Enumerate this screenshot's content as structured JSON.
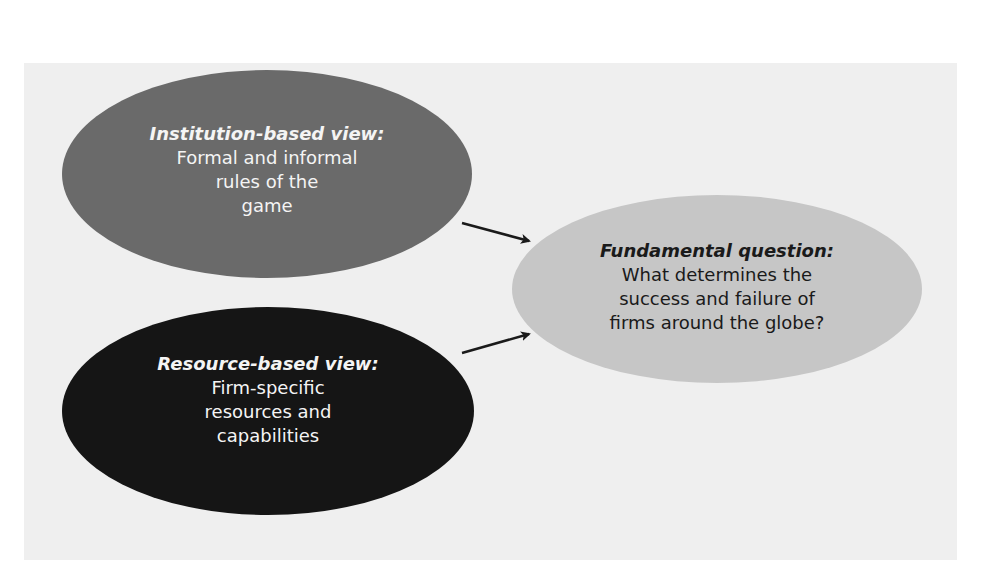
{
  "colors": {
    "background": "#ffffff",
    "panel": "#efefef",
    "institution_fill": "#6a6a6a",
    "resource_fill": "#151515",
    "question_fill": "#c6c6c6",
    "arrow": "#1a1a1a",
    "light_text": "#f4f4f4",
    "dark_text": "#1a1a1a"
  },
  "nodes": [
    {
      "id": "institution-based-view",
      "title": "Institution-based view:",
      "lines": [
        "Formal and informal",
        "rules of the",
        "game"
      ]
    },
    {
      "id": "resource-based-view",
      "title": "Resource-based view:",
      "lines": [
        "Firm-specific",
        "resources and",
        "capabilities"
      ]
    },
    {
      "id": "fundamental-question",
      "title": "Fundamental question:",
      "lines": [
        "What determines the",
        "success and failure of",
        "firms around the globe?"
      ]
    }
  ],
  "edges": [
    {
      "from": "institution-based-view",
      "to": "fundamental-question"
    },
    {
      "from": "resource-based-view",
      "to": "fundamental-question"
    }
  ]
}
